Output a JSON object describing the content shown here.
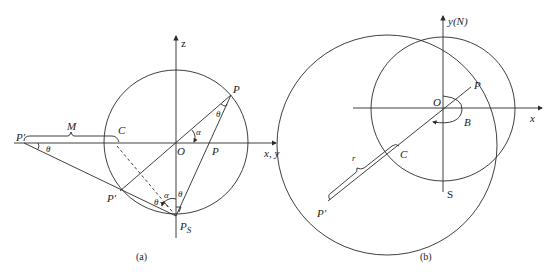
{
  "figure_a": {
    "caption": "(a)",
    "labels": {
      "z_axis": "z",
      "xy_axis": "x, y",
      "origin": "O",
      "point_p_top": "P",
      "point_p_axis": "P",
      "point_p_prime_circle": "P′",
      "point_p_prime_far": "P′",
      "point_ps": "P",
      "point_ps_sub": "S",
      "point_c": "C",
      "bracket_m": "M",
      "angle_alpha_origin": "α",
      "angle_alpha_bottom": "α",
      "angle_theta_top": "θ",
      "angle_theta_bottom_right": "θ",
      "angle_theta_bottom_left": "θ",
      "angle_theta_far": "θ"
    }
  },
  "figure_b": {
    "caption": "(b)",
    "labels": {
      "y_axis": "y(N)",
      "x_axis": "x",
      "origin": "O",
      "point_p": "P",
      "point_p_prime": "P′",
      "point_c": "C",
      "point_s": "S",
      "angle_b": "B",
      "bracket_r": "r"
    }
  }
}
